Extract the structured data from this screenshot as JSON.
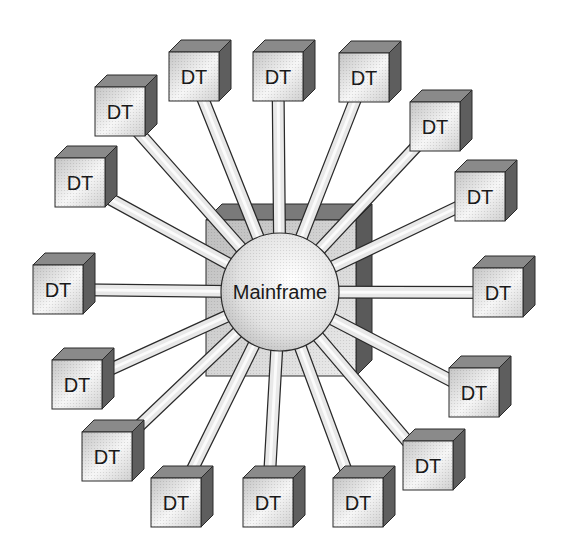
{
  "diagram": {
    "type": "star-topology",
    "hub": {
      "label": "Mainframe",
      "cx": 280,
      "cy": 292,
      "r": 59
    },
    "hub_box": {
      "x": 206,
      "y": 220,
      "w": 150,
      "h": 156,
      "depth": 16
    },
    "terminal_size": {
      "w": 50,
      "h": 49,
      "depth": 12
    },
    "terminals": [
      {
        "label": "DT",
        "x": 169,
        "y": 52
      },
      {
        "label": "DT",
        "x": 253,
        "y": 52
      },
      {
        "label": "DT",
        "x": 339,
        "y": 53
      },
      {
        "label": "DT",
        "x": 410,
        "y": 102
      },
      {
        "label": "DT",
        "x": 455,
        "y": 172
      },
      {
        "label": "DT",
        "x": 473,
        "y": 268
      },
      {
        "label": "DT",
        "x": 449,
        "y": 368
      },
      {
        "label": "DT",
        "x": 403,
        "y": 441
      },
      {
        "label": "DT",
        "x": 333,
        "y": 478
      },
      {
        "label": "DT",
        "x": 243,
        "y": 478
      },
      {
        "label": "DT",
        "x": 151,
        "y": 478
      },
      {
        "label": "DT",
        "x": 82,
        "y": 432
      },
      {
        "label": "DT",
        "x": 52,
        "y": 360
      },
      {
        "label": "DT",
        "x": 33,
        "y": 265
      },
      {
        "label": "DT",
        "x": 55,
        "y": 158
      },
      {
        "label": "DT",
        "x": 95,
        "y": 87
      }
    ],
    "colors": {
      "stroke": "#2a2a2a",
      "front_light": "#f4f4f4",
      "front_dark": "#b8b8b8",
      "top_face": "#8a8a8a",
      "side_face": "#5e5e5e",
      "hub_box_front": "#c4c4c4",
      "hub_box_top": "#7a7a7a",
      "hub_box_side": "#5a5a5a",
      "cable_fill": "#e8e8e8"
    }
  }
}
